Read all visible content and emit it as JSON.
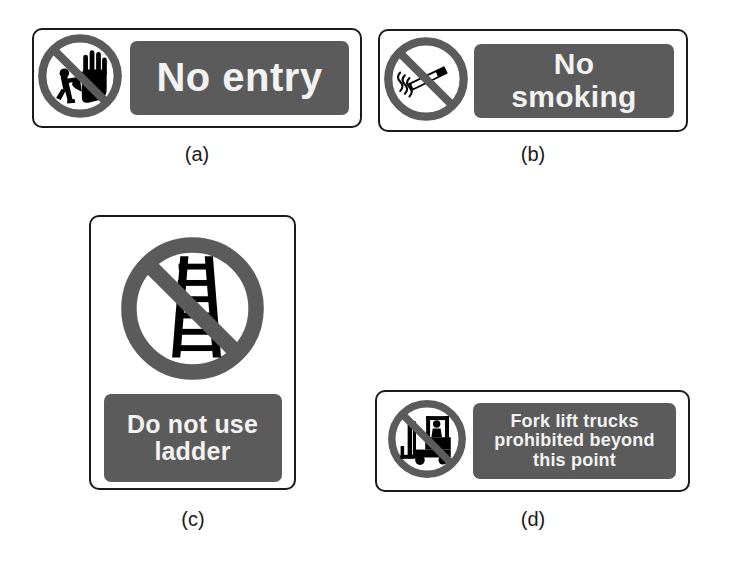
{
  "figure": {
    "background_color": "#ffffff",
    "sign_border_color": "#1a1a1a",
    "panel_color": "#5b5b5b",
    "panel_text_color": "#f2f2f2",
    "pictogram_ring_color": "#5b5b5b",
    "pictogram_symbol_color": "#000000"
  },
  "signs": [
    {
      "id": "a",
      "caption": "(a)",
      "orientation": "landscape",
      "icon_name": "no-entry-pictogram",
      "icon_description": "circle with diagonal slash over a raised hand and walking person",
      "text_lines": [
        "No entry"
      ]
    },
    {
      "id": "b",
      "caption": "(b)",
      "orientation": "landscape",
      "icon_name": "no-smoking-pictogram",
      "icon_description": "circle with diagonal slash over a lit cigarette with smoke",
      "text_lines": [
        "No",
        "smoking"
      ]
    },
    {
      "id": "c",
      "caption": "(c)",
      "orientation": "portrait",
      "icon_name": "no-ladder-pictogram",
      "icon_description": "circle with diagonal slash over a ladder",
      "text_lines": [
        "Do not use",
        "ladder"
      ]
    },
    {
      "id": "d",
      "caption": "(d)",
      "orientation": "landscape",
      "icon_name": "no-forklift-pictogram",
      "icon_description": "circle with diagonal slash over a fork lift truck with driver",
      "text_lines": [
        "Fork lift trucks",
        "prohibited beyond",
        "this point"
      ]
    }
  ]
}
